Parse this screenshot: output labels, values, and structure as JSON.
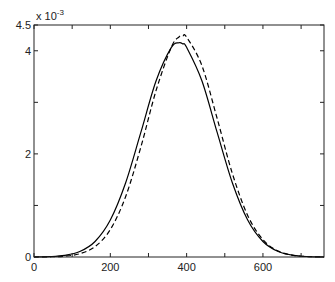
{
  "chart_data": {
    "type": "line",
    "title": "",
    "xlabel": "",
    "ylabel": "",
    "y_scale_label": "x 10",
    "y_scale_exponent": "-3",
    "xlim": [
      0,
      760
    ],
    "ylim": [
      0,
      4.5
    ],
    "grid": false,
    "legend": null,
    "x_ticks": [
      0,
      200,
      400,
      600
    ],
    "x_tick_labels": [
      "0",
      "200",
      "400",
      "600"
    ],
    "x_minor_ticks": [
      100,
      300,
      500,
      700
    ],
    "y_ticks": [
      0,
      2,
      4,
      4.5
    ],
    "y_tick_labels": [
      "0",
      "2",
      "4",
      "4.5"
    ],
    "y_minor_ticks": [
      1,
      3
    ],
    "x": [
      0,
      40,
      80,
      120,
      160,
      200,
      240,
      280,
      320,
      360,
      380,
      390,
      400,
      440,
      480,
      520,
      560,
      600,
      640,
      680,
      720,
      760
    ],
    "series": [
      {
        "name": "solid",
        "style": "solid",
        "color": "#000000",
        "values": [
          0.0016,
          0.0078,
          0.0315,
          0.106,
          0.301,
          0.717,
          1.435,
          2.416,
          3.419,
          4.067,
          4.156,
          4.134,
          4.067,
          3.419,
          2.416,
          1.435,
          0.717,
          0.301,
          0.106,
          0.0315,
          0.0078,
          0.0016
        ]
      },
      {
        "name": "dashed",
        "style": "dashed",
        "color": "#000000",
        "values": [
          0.0007,
          0.0036,
          0.0166,
          0.0634,
          0.2015,
          0.532,
          1.168,
          2.131,
          3.232,
          4.073,
          4.268,
          4.29,
          4.265,
          3.713,
          2.686,
          1.615,
          0.807,
          0.3355,
          0.1157,
          0.0332,
          0.0079,
          0.0016
        ]
      }
    ],
    "units_note": "y values are in units of 10^-3"
  }
}
